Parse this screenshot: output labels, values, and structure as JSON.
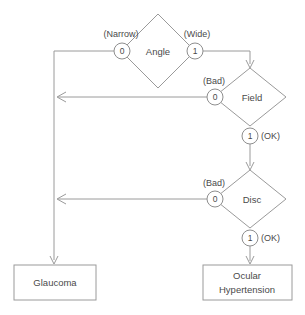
{
  "diagram": {
    "type": "decision-tree",
    "title": "",
    "background_color": "#ffffff",
    "line_color": "#9a9a9a",
    "text_color": "#4a4a4a",
    "decisions": [
      {
        "id": "angle",
        "label": "Angle",
        "cx": 158,
        "cy": 51,
        "rx": 37,
        "ry": 37,
        "ports": [
          {
            "id": "angle-0",
            "value": "0",
            "annotation": "(Narrow)",
            "annotation_side": "left",
            "cx": 122,
            "cy": 51,
            "r": 8,
            "annot_x": 120,
            "annot_y": 35
          },
          {
            "id": "angle-1",
            "value": "1",
            "annotation": "(Wide)",
            "annotation_side": "right",
            "cx": 195,
            "cy": 51,
            "r": 8,
            "annot_x": 196,
            "annot_y": 35
          }
        ]
      },
      {
        "id": "field",
        "label": "Field",
        "cx": 250,
        "cy": 97,
        "rx": 36,
        "ry": 29,
        "ports": [
          {
            "id": "field-0",
            "value": "0",
            "annotation": "(Bad)",
            "annotation_side": "left",
            "cx": 215,
            "cy": 97,
            "r": 8,
            "annot_x": 214,
            "annot_y": 82
          },
          {
            "id": "field-1",
            "value": "1",
            "annotation": "(OK)",
            "annotation_side": "right",
            "cx": 250,
            "cy": 136,
            "r": 8,
            "annot_x": 262,
            "annot_y": 136
          }
        ]
      },
      {
        "id": "disc",
        "label": "Disc",
        "cx": 250,
        "cy": 199,
        "rx": 36,
        "ry": 29,
        "ports": [
          {
            "id": "disc-0",
            "value": "0",
            "annotation": "(Bad)",
            "annotation_side": "left",
            "cx": 215,
            "cy": 199,
            "r": 8,
            "annot_x": 214,
            "annot_y": 184
          },
          {
            "id": "disc-1",
            "value": "1",
            "annotation": "(OK)",
            "annotation_side": "right",
            "cx": 250,
            "cy": 238,
            "r": 8,
            "annot_x": 262,
            "annot_y": 238
          }
        ]
      }
    ],
    "terminals": [
      {
        "id": "glaucoma",
        "lines": [
          "Glaucoma"
        ],
        "x": 14,
        "y": 265,
        "width": 82,
        "height": 35
      },
      {
        "id": "ocular-hypertension",
        "lines": [
          "Ocular",
          "Hypertension"
        ],
        "x": 203,
        "y": 265,
        "width": 89,
        "height": 35
      }
    ],
    "edges": [
      {
        "id": "angle0-to-spine",
        "from": "angle-0",
        "to": "glaucoma",
        "path": "M 114 51 L 54 51 L 54 260",
        "arrow": "end-down"
      },
      {
        "id": "angle1-to-field",
        "from": "angle-1",
        "to": "field",
        "path": "M 203 51 L 250 51 L 250 64",
        "arrow": "end-down"
      },
      {
        "id": "field0-to-spine",
        "from": "field-0",
        "to": "glaucoma-spine",
        "path": "M 207 97 L 58 97",
        "arrow": "end-left"
      },
      {
        "id": "field1-to-disc",
        "from": "field-1",
        "to": "disc",
        "path": "M 250 144 L 250 166",
        "arrow": "end-down"
      },
      {
        "id": "disc0-to-spine",
        "from": "disc-0",
        "to": "glaucoma-spine",
        "path": "M 207 199 L 58 199",
        "arrow": "end-left"
      },
      {
        "id": "disc1-to-ocular",
        "from": "disc-1",
        "to": "ocular-hypertension",
        "path": "M 250 246 L 250 261",
        "arrow": "end-down"
      }
    ]
  }
}
